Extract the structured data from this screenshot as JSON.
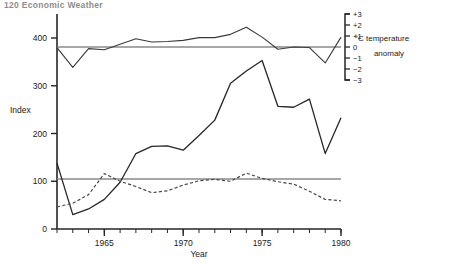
{
  "header": {
    "clipped_text": "120   Economic Weather"
  },
  "chart_data": {
    "type": "line",
    "title": "",
    "xlabel": "Year",
    "ylabel": "Index",
    "xlim": [
      1962,
      1980
    ],
    "ylim": [
      0,
      440
    ],
    "yticks": [
      0,
      100,
      200,
      300,
      400
    ],
    "xticks": [
      1965,
      1970,
      1975,
      1980
    ],
    "xtick_labels": [
      "1965",
      "1970",
      "1975",
      "1980"
    ],
    "ytick_labels": [
      "0",
      "100",
      "200",
      "300",
      "400"
    ],
    "grid": false,
    "legend_position": "right",
    "secondary_axis": {
      "label_line1": "°C temperature",
      "label_line2": "anomaly",
      "ticks": [
        3,
        2,
        1,
        0,
        -1,
        -2,
        -3
      ],
      "tick_labels": [
        "+3",
        "+2",
        "+1",
        "0",
        "−1",
        "−2",
        "−3"
      ],
      "lim": [
        -3,
        3
      ],
      "style": "bracket"
    },
    "reference_lines": [
      {
        "name": "anomaly-zero-line",
        "axis": "secondary",
        "value": 0
      },
      {
        "name": "index-100-line",
        "axis": "primary",
        "value": 100
      }
    ],
    "x": [
      1962,
      1963,
      1964,
      1965,
      1966,
      1967,
      1968,
      1969,
      1970,
      1971,
      1972,
      1973,
      1974,
      1975,
      1976,
      1977,
      1978,
      1979,
      1980
    ],
    "series": [
      {
        "name": "Index (solid)",
        "axis": "primary",
        "style": "solid",
        "color": "#262626",
        "values": [
          138,
          30,
          42,
          62,
          98,
          158,
          173,
          174,
          165,
          196,
          228,
          305,
          331,
          353,
          257,
          255,
          272,
          158,
          233
        ]
      },
      {
        "name": "Index (dashed)",
        "axis": "primary",
        "style": "dashed",
        "color": "#4a4a4a",
        "values": [
          46,
          54,
          72,
          116,
          100,
          89,
          76,
          80,
          92,
          101,
          104,
          100,
          117,
          106,
          99,
          94,
          79,
          62,
          59
        ]
      },
      {
        "name": "°C temperature anomaly",
        "axis": "secondary",
        "style": "solid",
        "color": "#3a3a3a",
        "values": [
          -0.05,
          -1.85,
          -0.15,
          -0.25,
          0.25,
          0.75,
          0.45,
          0.5,
          0.6,
          0.85,
          0.85,
          1.15,
          1.8,
          0.9,
          -0.2,
          0.0,
          -0.05,
          -1.45,
          0.9
        ]
      }
    ]
  }
}
